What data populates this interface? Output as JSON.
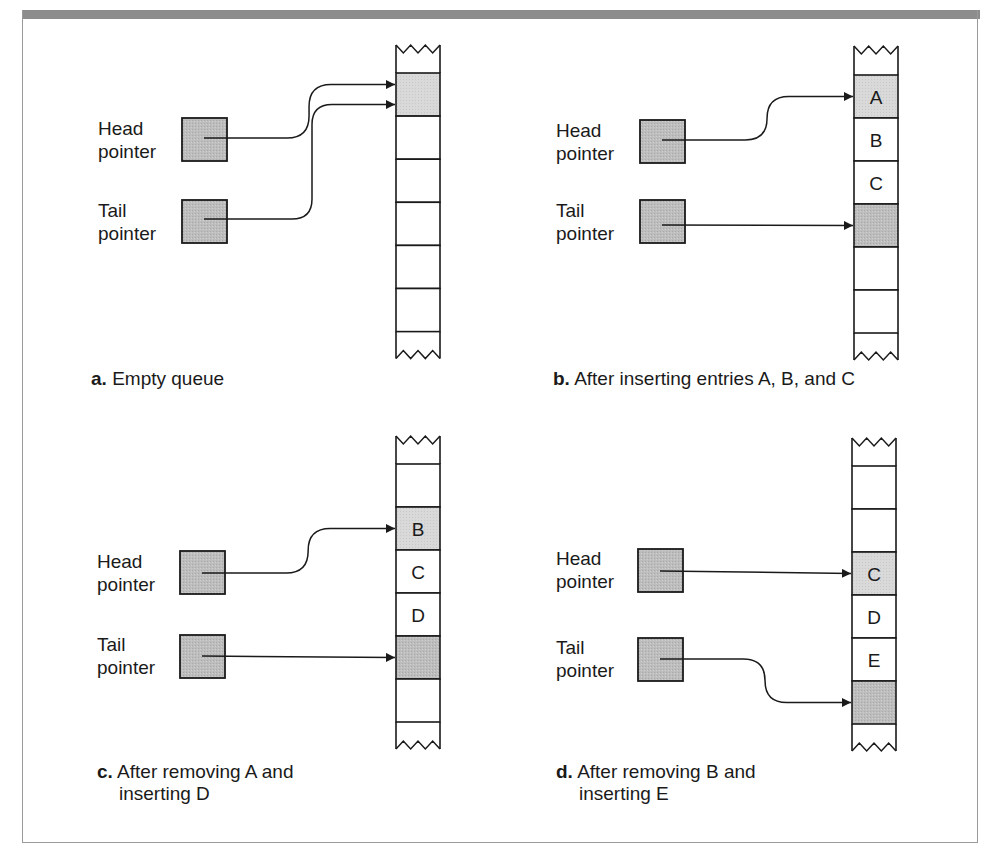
{
  "figure": {
    "colors": {
      "frame": "#9a9a9a",
      "topbar": "#8c8c8c",
      "pointer_fill": "#b4b4b4",
      "head_cell_fill_a": "#d6d6d6",
      "highlight_fill": "#bcbcbc",
      "line": "#1a1a1a"
    },
    "panels": [
      {
        "id": "a",
        "caption_letter": "a.",
        "caption_line1": "Empty queue",
        "caption_line2": "",
        "head_label_1": "Head",
        "head_label_2": "pointer",
        "tail_label_1": "Tail",
        "tail_label_2": "pointer",
        "cells": [
          "",
          "",
          "",
          "",
          "",
          ""
        ],
        "head_index": 0,
        "tail_index": 0
      },
      {
        "id": "b",
        "caption_letter": "b.",
        "caption_line1": "After inserting entries A, B, and C",
        "caption_line2": "",
        "head_label_1": "Head",
        "head_label_2": "pointer",
        "tail_label_1": "Tail",
        "tail_label_2": "pointer",
        "cells": [
          "A",
          "B",
          "C",
          "",
          "",
          ""
        ],
        "head_index": 0,
        "tail_index": 3
      },
      {
        "id": "c",
        "caption_letter": "c.",
        "caption_line1": "After removing A and",
        "caption_line2": "inserting D",
        "head_label_1": "Head",
        "head_label_2": "pointer",
        "tail_label_1": "Tail",
        "tail_label_2": "pointer",
        "cells": [
          "",
          "B",
          "C",
          "D",
          "",
          ""
        ],
        "head_index": 1,
        "tail_index": 4
      },
      {
        "id": "d",
        "caption_letter": "d.",
        "caption_line1": "After removing B and",
        "caption_line2": "inserting E",
        "head_label_1": "Head",
        "head_label_2": "pointer",
        "tail_label_1": "Tail",
        "tail_label_2": "pointer",
        "cells": [
          "",
          "",
          "C",
          "D",
          "E",
          ""
        ],
        "head_index": 2,
        "tail_index": 5
      }
    ]
  }
}
